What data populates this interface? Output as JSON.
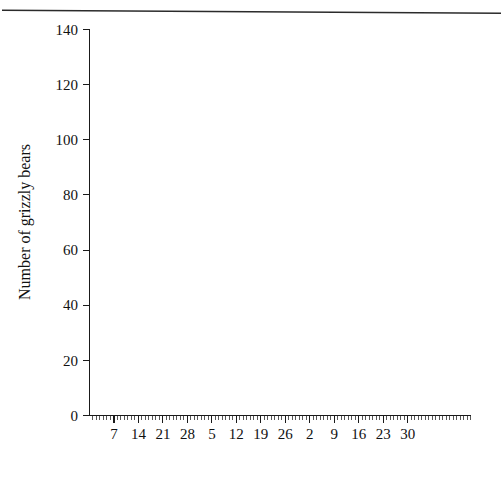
{
  "figure": {
    "scan_artifact": "horizontal-rule"
  },
  "axes": {
    "y_title": "Number of grizzly bears",
    "y_ticks": [
      "0",
      "20",
      "40",
      "60",
      "80",
      "100",
      "120",
      "140"
    ],
    "x_day_ticks": [
      "7",
      "14",
      "21",
      "28",
      "5",
      "12",
      "19",
      "26",
      "2",
      "9",
      "16",
      "23",
      "30"
    ],
    "x_months": [
      "June",
      "July",
      "August"
    ]
  },
  "legend": {
    "entries": [
      {
        "label": "1964",
        "marker": "circle-icon"
      },
      {
        "label": "1965",
        "marker": "square-icon"
      },
      {
        "label": "1966",
        "marker": "triangle-icon"
      }
    ]
  },
  "chart_data": {
    "type": "scatter",
    "title": "",
    "xlabel": "",
    "ylabel": "Number of grizzly bears",
    "ylim": [
      0,
      140
    ],
    "ytick_step": 20,
    "xlim": [
      1,
      92
    ],
    "grid": false,
    "legend_position": "inside-right",
    "x_axis_note": "Day of season: x=1 is June 1, x=30 is June 30, x=31 is July 1, x=61 is August 1, x=91 is August 31. Minor ticks every day, major labelled ticks every 7 days.",
    "x_major_ticks": [
      {
        "day": 7,
        "label": "7",
        "month": "June"
      },
      {
        "day": 14,
        "label": "14",
        "month": "June"
      },
      {
        "day": 21,
        "label": "21",
        "month": "June"
      },
      {
        "day": 28,
        "label": "28",
        "month": "June"
      },
      {
        "day": 35,
        "label": "5",
        "month": "July"
      },
      {
        "day": 42,
        "label": "12",
        "month": "July"
      },
      {
        "day": 49,
        "label": "19",
        "month": "July"
      },
      {
        "day": 56,
        "label": "26",
        "month": "July"
      },
      {
        "day": 63,
        "label": "2",
        "month": "August"
      },
      {
        "day": 70,
        "label": "9",
        "month": "August"
      },
      {
        "day": 77,
        "label": "16",
        "month": "August"
      },
      {
        "day": 84,
        "label": "23",
        "month": "August"
      },
      {
        "day": 91,
        "label": "30",
        "month": "August"
      }
    ],
    "series": [
      {
        "name": "1964",
        "marker": "circle",
        "filled": false,
        "points": [
          [
            3,
            34
          ],
          [
            5,
            39
          ],
          [
            6,
            41
          ],
          [
            6.8,
            42
          ],
          [
            8,
            45
          ],
          [
            9,
            48
          ],
          [
            10,
            47
          ],
          [
            10.8,
            51
          ],
          [
            12,
            53
          ],
          [
            13,
            54
          ],
          [
            14,
            55
          ],
          [
            14.8,
            56
          ],
          [
            16.5,
            60
          ],
          [
            17.5,
            62
          ],
          [
            19,
            66
          ],
          [
            20,
            67
          ],
          [
            22.5,
            75
          ],
          [
            23.5,
            76
          ],
          [
            24.5,
            77
          ],
          [
            26,
            78
          ],
          [
            28,
            80
          ],
          [
            29,
            81
          ],
          [
            33,
            87
          ],
          [
            34,
            87
          ],
          [
            38,
            93
          ],
          [
            40,
            96
          ],
          [
            43.5,
            99
          ],
          [
            44.5,
            100
          ],
          [
            48,
            106
          ],
          [
            49.5,
            107
          ],
          [
            51,
            108
          ],
          [
            55,
            110
          ],
          [
            56.5,
            111
          ],
          [
            58,
            112
          ],
          [
            59.5,
            113
          ],
          [
            64,
            113
          ],
          [
            68.5,
            117
          ],
          [
            70,
            118
          ],
          [
            76,
            119
          ],
          [
            85,
            124
          ],
          [
            86.5,
            125
          ]
        ]
      },
      {
        "name": "1965",
        "marker": "square",
        "filled": false,
        "points": [
          [
            2,
            10
          ],
          [
            3.5,
            17
          ],
          [
            5,
            24.5
          ],
          [
            7.5,
            41
          ],
          [
            8.5,
            43
          ],
          [
            9.5,
            44
          ],
          [
            10.5,
            45
          ],
          [
            11.5,
            45
          ],
          [
            12.5,
            46
          ],
          [
            13.5,
            46.5
          ],
          [
            14.3,
            47
          ],
          [
            16.5,
            54
          ],
          [
            17.5,
            54
          ],
          [
            18.5,
            59
          ],
          [
            19.5,
            61
          ],
          [
            20.5,
            66
          ],
          [
            22,
            66
          ],
          [
            25,
            78
          ],
          [
            26,
            79
          ],
          [
            29,
            81
          ],
          [
            33.5,
            87
          ],
          [
            34.5,
            87
          ],
          [
            36.5,
            92
          ],
          [
            37.5,
            93
          ],
          [
            40.5,
            94
          ],
          [
            43,
            97
          ],
          [
            46,
            94
          ],
          [
            47.5,
            97
          ],
          [
            51,
            108
          ],
          [
            52.5,
            110
          ],
          [
            54,
            112
          ],
          [
            56,
            117
          ],
          [
            57.5,
            118
          ],
          [
            60,
            120
          ],
          [
            61.5,
            122
          ],
          [
            65,
            123
          ],
          [
            66.5,
            123
          ],
          [
            69,
            124
          ],
          [
            71,
            124
          ],
          [
            77,
            126
          ],
          [
            84,
            127
          ],
          [
            88,
            130
          ]
        ]
      },
      {
        "name": "1966",
        "marker": "triangle",
        "filled": false,
        "points": [
          [
            7.5,
            20
          ],
          [
            9.5,
            30
          ],
          [
            10.5,
            31
          ],
          [
            11,
            31.5
          ],
          [
            12.5,
            41
          ],
          [
            13.5,
            44
          ],
          [
            14.3,
            47
          ],
          [
            15,
            44
          ],
          [
            16,
            52
          ],
          [
            17,
            54
          ],
          [
            20.5,
            65
          ],
          [
            25.5,
            77
          ],
          [
            27,
            80
          ],
          [
            30,
            87
          ],
          [
            31.5,
            88
          ],
          [
            33.5,
            94
          ],
          [
            36,
            95
          ],
          [
            37,
            99
          ],
          [
            38,
            100
          ],
          [
            40,
            102
          ],
          [
            43,
            106
          ],
          [
            44.5,
            109
          ],
          [
            46.5,
            115
          ],
          [
            47.5,
            116
          ],
          [
            50,
            117
          ],
          [
            51.5,
            118
          ],
          [
            54,
            119
          ],
          [
            56,
            119
          ],
          [
            58,
            120
          ],
          [
            60,
            122
          ],
          [
            62,
            122
          ],
          [
            65,
            123
          ],
          [
            68.5,
            122
          ],
          [
            71.5,
            122
          ],
          [
            78,
            125
          ],
          [
            86,
            126
          ]
        ]
      }
    ],
    "special_points": [
      {
        "note": "one filled black marker overlapping the June-14 cluster",
        "series": "1965",
        "x": 14.3,
        "y": 47,
        "filled": true
      }
    ]
  }
}
